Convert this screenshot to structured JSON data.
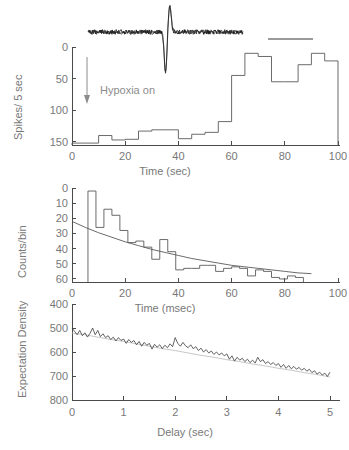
{
  "figure": {
    "title": "",
    "background_color": "#ffffff",
    "ink_color": "#4a4a4a",
    "label_color": "#787878"
  },
  "chart_data": [
    {
      "id": "panel-top-rate-histogram",
      "type": "bar",
      "title": "",
      "xlabel": "Time (sec)",
      "ylabel": "Spikes/ 5 sec",
      "xlim": [
        0,
        100
      ],
      "ylim": [
        0,
        155
      ],
      "xticks": [
        0,
        20,
        40,
        60,
        80,
        100
      ],
      "yticks": [
        0,
        50,
        100,
        150
      ],
      "grid": false,
      "legend": "",
      "bin_width": 5,
      "bin_starts": [
        0,
        5,
        10,
        15,
        20,
        25,
        30,
        35,
        40,
        45,
        50,
        55,
        60,
        65,
        70,
        75,
        80,
        85,
        90,
        95
      ],
      "values": [
        3,
        3,
        15,
        8,
        9,
        22,
        24,
        24,
        10,
        17,
        20,
        37,
        110,
        145,
        140,
        100,
        100,
        127,
        145,
        133
      ],
      "annotations": [
        {
          "name": "hypoxia-on",
          "text": "Hypoxia  on",
          "x": 10,
          "arrow": "down"
        },
        {
          "name": "scale-bar",
          "text": "",
          "x": 85,
          "y": 150
        }
      ]
    },
    {
      "id": "panel-middle-interval-histogram",
      "type": "bar",
      "title": "",
      "xlabel": "Time (msec)",
      "ylabel": "Counts/bin",
      "xlim": [
        0,
        100
      ],
      "ylim": [
        0,
        62
      ],
      "xticks": [
        0,
        20,
        40,
        60,
        80,
        100
      ],
      "yticks": [
        0,
        10,
        20,
        30,
        40,
        50,
        60
      ],
      "grid": false,
      "legend": "",
      "bin_width": 3,
      "bin_starts": [
        6,
        9,
        12,
        15,
        18,
        21,
        24,
        27,
        30,
        33,
        36,
        39,
        42,
        45,
        48,
        51,
        54,
        57,
        60,
        63,
        66,
        69,
        72,
        75,
        78,
        81,
        84
      ],
      "values": [
        60,
        36,
        48,
        44,
        34,
        26,
        27,
        23,
        15,
        28,
        20,
        8,
        9,
        9,
        11,
        11,
        7,
        9,
        10,
        9,
        4,
        8,
        7,
        3,
        2,
        4,
        3
      ],
      "series": [
        {
          "name": "exponential-fit",
          "type": "line",
          "x": [
            0,
            5,
            10,
            15,
            20,
            25,
            30,
            35,
            40,
            45,
            50,
            55,
            60,
            65,
            70,
            75,
            80,
            85,
            90
          ],
          "values": [
            40,
            36,
            32.5,
            29.5,
            26.5,
            24,
            21.5,
            19.5,
            17.5,
            15.5,
            14,
            12.5,
            11,
            10,
            9,
            8,
            7,
            6,
            5.5
          ]
        }
      ]
    },
    {
      "id": "panel-bottom-expectation-density",
      "type": "line",
      "title": "",
      "xlabel": "Delay (sec)",
      "ylabel": "Expectation Density",
      "xlim": [
        0,
        5
      ],
      "ylim": [
        400,
        800
      ],
      "xticks": [
        0,
        1,
        2,
        3,
        4,
        5
      ],
      "yticks": [
        400,
        500,
        600,
        700,
        800
      ],
      "grid": false,
      "legend": "",
      "series": [
        {
          "name": "expectation-density-observed",
          "style": "solid-dark",
          "x": [
            0.0,
            0.05,
            0.1,
            0.15,
            0.2,
            0.25,
            0.3,
            0.35,
            0.4,
            0.45,
            0.5,
            0.55,
            0.6,
            0.65,
            0.7,
            0.75,
            0.8,
            0.85,
            0.9,
            0.95,
            1.0,
            1.05,
            1.1,
            1.15,
            1.2,
            1.25,
            1.3,
            1.35,
            1.4,
            1.45,
            1.5,
            1.55,
            1.6,
            1.65,
            1.7,
            1.75,
            1.8,
            1.85,
            1.9,
            1.95,
            2.0,
            2.05,
            2.1,
            2.15,
            2.2,
            2.25,
            2.3,
            2.35,
            2.4,
            2.45,
            2.5,
            2.55,
            2.6,
            2.65,
            2.7,
            2.75,
            2.8,
            2.85,
            2.9,
            2.95,
            3.0,
            3.05,
            3.1,
            3.15,
            3.2,
            3.25,
            3.3,
            3.35,
            3.4,
            3.45,
            3.5,
            3.55,
            3.6,
            3.65,
            3.7,
            3.75,
            3.8,
            3.85,
            3.9,
            3.95,
            4.0,
            4.05,
            4.1,
            4.15,
            4.2,
            4.25,
            4.3,
            4.35,
            4.4,
            4.45,
            4.5,
            4.55,
            4.6,
            4.65,
            4.7,
            4.75,
            4.8,
            4.85,
            4.9,
            4.95,
            5.0
          ],
          "values": [
            700,
            686,
            672,
            690,
            668,
            680,
            662,
            678,
            700,
            672,
            690,
            664,
            676,
            660,
            668,
            652,
            662,
            646,
            660,
            648,
            654,
            636,
            652,
            640,
            648,
            630,
            644,
            624,
            640,
            628,
            636,
            612,
            632,
            620,
            630,
            614,
            628,
            618,
            634,
            622,
            660,
            636,
            624,
            640,
            626,
            618,
            630,
            614,
            622,
            606,
            616,
            600,
            610,
            596,
            604,
            590,
            600,
            588,
            596,
            584,
            592,
            570,
            584,
            562,
            578,
            566,
            574,
            560,
            570,
            556,
            566,
            554,
            578,
            560,
            568,
            552,
            560,
            548,
            556,
            544,
            552,
            536,
            548,
            532,
            544,
            530,
            540,
            528,
            536,
            524,
            532,
            520,
            528,
            514,
            522,
            508,
            516,
            504,
            512,
            498,
            516
          ]
        },
        {
          "name": "expectation-density-expected",
          "style": "light-smooth",
          "x": [
            0.0,
            0.25,
            0.5,
            0.75,
            1.0,
            1.25,
            1.5,
            1.75,
            2.0,
            2.25,
            2.5,
            2.75,
            3.0,
            3.25,
            3.5,
            3.75,
            4.0,
            4.25,
            4.5,
            4.75,
            5.0
          ],
          "values": [
            678,
            672,
            662,
            652,
            644,
            634,
            624,
            614,
            606,
            596,
            586,
            578,
            568,
            560,
            550,
            542,
            532,
            524,
            514,
            506,
            496
          ]
        }
      ]
    }
  ],
  "panels": {
    "top": {
      "ylabel": "Spikes/ 5 sec",
      "xlabel": "Time (sec)",
      "yticks": [
        "0",
        "50",
        "100",
        "150"
      ],
      "xticks": [
        "0",
        "20",
        "40",
        "60",
        "80",
        "100"
      ],
      "annotation_text": "Hypoxia  on",
      "waveform_name": "extracellular-spike-waveform",
      "scalebar_name": "waveform-scale-bar"
    },
    "middle": {
      "ylabel": "Counts/bin",
      "xlabel": "Time (msec)",
      "yticks": [
        "0",
        "10",
        "20",
        "30",
        "40",
        "50",
        "60"
      ],
      "xticks": [
        "0",
        "20",
        "40",
        "60",
        "80",
        "100"
      ],
      "fit_name": "exponential-fit-curve"
    },
    "bottom": {
      "ylabel": "Expectation Density",
      "xlabel": "Delay (sec)",
      "yticks": [
        "400",
        "500",
        "600",
        "700",
        "800"
      ],
      "xticks": [
        "0",
        "1",
        "2",
        "3",
        "4",
        "5"
      ],
      "observed_name": "observed-density-trace",
      "expected_name": "expected-density-trace"
    }
  }
}
